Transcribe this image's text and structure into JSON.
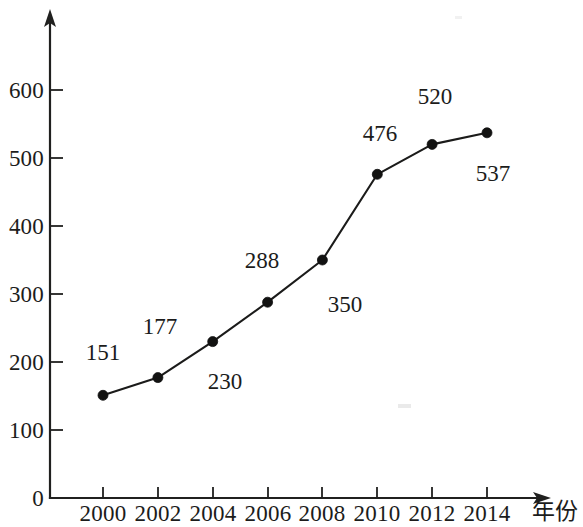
{
  "chart_data": {
    "type": "line",
    "title": "",
    "xlabel": "年份",
    "ylabel": "",
    "categories": [
      "2000",
      "2002",
      "2004",
      "2006",
      "2008",
      "2010",
      "2012",
      "2014"
    ],
    "values": [
      151,
      177,
      230,
      288,
      350,
      476,
      520,
      537
    ],
    "point_labels": [
      "151",
      "177",
      "230",
      "288",
      "350",
      "476",
      "520",
      "537"
    ],
    "x_tick_labels": [
      "2000",
      "2002",
      "2004",
      "2006",
      "2008",
      "2010",
      "2012",
      "2014"
    ],
    "y_tick_labels": [
      "0",
      "100",
      "200",
      "300",
      "400",
      "500",
      "600"
    ],
    "y_tick_values": [
      0,
      100,
      200,
      300,
      400,
      500,
      600
    ],
    "ylim": [
      0,
      680
    ],
    "xlim": [
      2000,
      2014
    ],
    "grid": false,
    "legend": null,
    "legend_position": "none",
    "marker": "filled-circle",
    "line_color": "#1b1b1a",
    "marker_color": "#121211",
    "axis_color": "#20201f",
    "background_color": "#ffffff",
    "axis_arrows": {
      "x": "right",
      "y": "up"
    },
    "label_offsets": [
      {
        "dx": -18,
        "dy": -34
      },
      {
        "dx": -14,
        "dy": -32
      },
      {
        "dx": 26,
        "dy": 34
      },
      {
        "dx": -18,
        "dy": -30
      },
      {
        "dx": 24,
        "dy": 38
      },
      {
        "dx": -22,
        "dy": -28
      },
      {
        "dx": -22,
        "dy": -32
      },
      {
        "dx": 6,
        "dy": 44
      }
    ]
  }
}
